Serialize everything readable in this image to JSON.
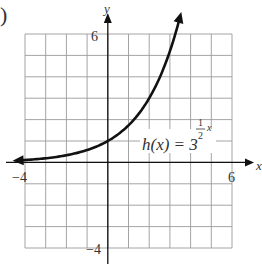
{
  "label_prefix": ")",
  "chart_data": {
    "type": "line",
    "title": "",
    "function_label": {
      "lhs": "h(x) = 3",
      "exp_num": "1",
      "exp_den": "2",
      "exp_var": "x"
    },
    "xlabel": "x",
    "ylabel": "y",
    "xlim": [
      -4,
      6
    ],
    "ylim": [
      -4,
      6
    ],
    "x_tick_labels": [
      "−4",
      "6"
    ],
    "y_tick_labels": [
      "6",
      "−4"
    ],
    "grid": true,
    "grid_step": 1,
    "series": [
      {
        "name": "h(x) = 3^(x/2)",
        "x": [
          -4.0,
          -3.5,
          -3.0,
          -2.5,
          -2.0,
          -1.5,
          -1.0,
          -0.5,
          0.0,
          0.5,
          1.0,
          1.5,
          2.0,
          2.5,
          3.0,
          3.5
        ],
        "values": [
          0.11,
          0.15,
          0.19,
          0.25,
          0.33,
          0.44,
          0.58,
          0.76,
          1.0,
          1.32,
          1.73,
          2.28,
          3.0,
          3.95,
          5.2,
          6.84
        ]
      }
    ],
    "colors": {
      "grid": "#9a9a9a",
      "axes": "#111111",
      "curve": "#111111"
    }
  }
}
